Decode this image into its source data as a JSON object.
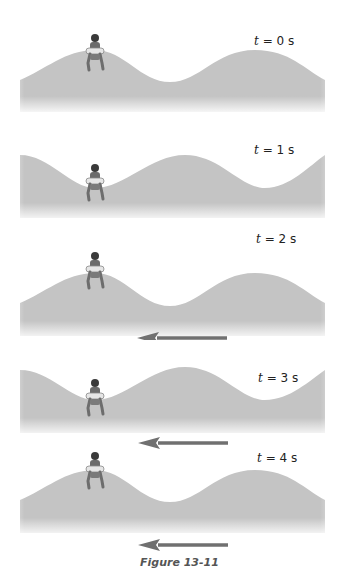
{
  "figure": {
    "caption": "Figure 13-11",
    "arrow_color": "#707070",
    "wave_color": "#c4c4c4",
    "panels": [
      {
        "t_var": "t",
        "t_eq": "= 0 s",
        "swimmer_position": "crest"
      },
      {
        "t_var": "t",
        "t_eq": "= 1 s",
        "swimmer_position": "trough"
      },
      {
        "t_var": "t",
        "t_eq": "= 2 s",
        "swimmer_position": "crest"
      },
      {
        "t_var": "t",
        "t_eq": "= 3 s",
        "swimmer_position": "trough"
      },
      {
        "t_var": "t",
        "t_eq": "= 4 s",
        "swimmer_position": "crest"
      }
    ],
    "wave_direction": "left"
  }
}
